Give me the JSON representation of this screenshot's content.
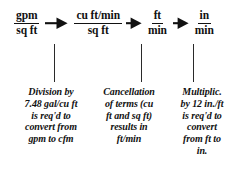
{
  "figure": {
    "background_color": "#ffffff",
    "ink_color": "#111111"
  },
  "chain": {
    "units": [
      {
        "id": "unit-1",
        "numerator": "gpm",
        "denominator": "sq ft"
      },
      {
        "id": "unit-2",
        "numerator": "cu ft/min",
        "denominator": "sq ft"
      },
      {
        "id": "unit-3",
        "numerator": "ft",
        "denominator": "min"
      },
      {
        "id": "unit-4",
        "numerator": "in",
        "denominator": "min"
      }
    ],
    "arrows": [
      {
        "id": "arrow-1",
        "glyph": "right-arrow"
      },
      {
        "id": "arrow-2",
        "glyph": "right-arrow"
      },
      {
        "id": "arrow-3",
        "glyph": "right-arrow"
      }
    ]
  },
  "captions": [
    {
      "id": "caption-1",
      "text": "Division by\n7.48 gal/cu ft\nis req'd to\nconvert from\ngpm to cfm"
    },
    {
      "id": "caption-2",
      "text": "Cancellation\nof terms (cu\nft and sq ft)\nresults in\nft/min"
    },
    {
      "id": "caption-3",
      "text": "Multiplic.\nby 12 in./ft\nis req'd to\nconvert\nfrom ft to\nin."
    }
  ],
  "connectors": [
    {
      "id": "connector-1"
    },
    {
      "id": "connector-2"
    },
    {
      "id": "connector-3"
    }
  ]
}
